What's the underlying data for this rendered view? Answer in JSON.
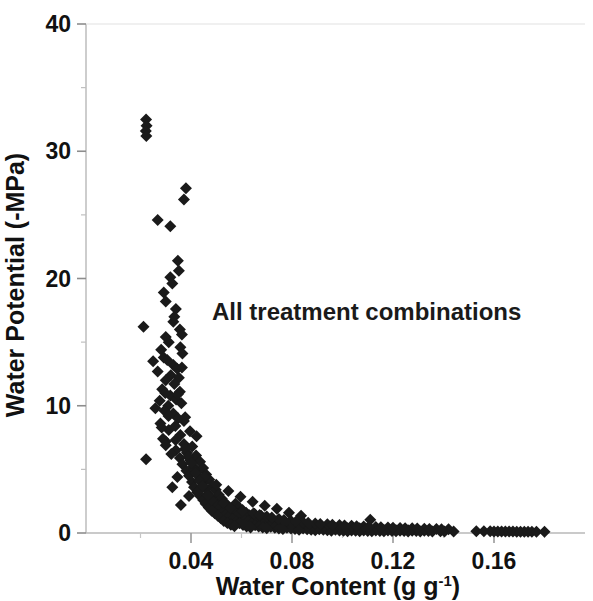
{
  "chart_data": {
    "type": "scatter",
    "title": "",
    "annotation": "All treatment combinations",
    "xlabel_main": "Water Content (g g",
    "xlabel_sup": "-1",
    "xlabel_tail": ")",
    "xlabel_full": "Water Content (g g-1)",
    "ylabel": "Water Potential (-MPa)",
    "xlim": [
      0.013,
      0.185
    ],
    "ylim": [
      0,
      40
    ],
    "xticks": [
      0.04,
      0.08,
      0.12,
      0.16
    ],
    "xtick_labels": [
      "0.04",
      "0.08",
      "0.12",
      "0.16"
    ],
    "yticks": [
      0,
      10,
      20,
      30,
      40
    ],
    "ytick_labels": [
      "0",
      "10",
      "20",
      "30",
      "40"
    ],
    "x_minor_ticks": [
      0.02,
      0.06,
      0.1,
      0.14,
      0.18
    ],
    "y_minor_ticks": [
      5,
      15,
      25,
      35
    ],
    "grid": false,
    "marker": "diamond",
    "marker_color": "#1a1a1a",
    "marker_size": 6,
    "axis_color": "#b8b8b8",
    "series": [
      {
        "name": "All treatment combinations",
        "points": [
          [
            0.0222,
            32.5
          ],
          [
            0.0224,
            32.0
          ],
          [
            0.0221,
            31.6
          ],
          [
            0.0223,
            31.2
          ],
          [
            0.038,
            27.1
          ],
          [
            0.0372,
            26.2
          ],
          [
            0.0268,
            24.6
          ],
          [
            0.0318,
            24.1
          ],
          [
            0.0348,
            21.4
          ],
          [
            0.0352,
            20.6
          ],
          [
            0.0318,
            20.1
          ],
          [
            0.0326,
            19.6
          ],
          [
            0.0292,
            18.9
          ],
          [
            0.03,
            18.2
          ],
          [
            0.0212,
            16.2
          ],
          [
            0.034,
            17.6
          ],
          [
            0.033,
            16.6
          ],
          [
            0.0356,
            16.0
          ],
          [
            0.03,
            15.4
          ],
          [
            0.0312,
            15.0
          ],
          [
            0.0358,
            14.6
          ],
          [
            0.0366,
            14.1
          ],
          [
            0.0282,
            14.4
          ],
          [
            0.0292,
            13.8
          ],
          [
            0.033,
            13.2
          ],
          [
            0.0345,
            12.9
          ],
          [
            0.032,
            12.4
          ],
          [
            0.0352,
            12.2
          ],
          [
            0.03,
            12.0
          ],
          [
            0.0334,
            11.7
          ],
          [
            0.0286,
            11.3
          ],
          [
            0.0356,
            11.1
          ],
          [
            0.0318,
            10.8
          ],
          [
            0.0341,
            10.5
          ],
          [
            0.0362,
            10.2
          ],
          [
            0.031,
            10.0
          ],
          [
            0.0295,
            9.6
          ],
          [
            0.033,
            9.4
          ],
          [
            0.0349,
            9.0
          ],
          [
            0.0372,
            8.8
          ],
          [
            0.0279,
            8.6
          ],
          [
            0.0338,
            8.4
          ],
          [
            0.0312,
            8.1
          ],
          [
            0.0396,
            8.0
          ],
          [
            0.0358,
            7.7
          ],
          [
            0.0422,
            7.6
          ],
          [
            0.0222,
            5.8
          ],
          [
            0.03,
            7.2
          ],
          [
            0.0372,
            7.0
          ],
          [
            0.0405,
            6.8
          ],
          [
            0.034,
            6.5
          ],
          [
            0.0384,
            6.3
          ],
          [
            0.042,
            6.1
          ],
          [
            0.0356,
            5.9
          ],
          [
            0.0398,
            5.7
          ],
          [
            0.0436,
            5.6
          ],
          [
            0.0366,
            5.4
          ],
          [
            0.041,
            5.2
          ],
          [
            0.0448,
            5.1
          ],
          [
            0.0382,
            4.9
          ],
          [
            0.0424,
            4.8
          ],
          [
            0.046,
            4.6
          ],
          [
            0.0392,
            4.5
          ],
          [
            0.0436,
            4.3
          ],
          [
            0.0472,
            4.2
          ],
          [
            0.0346,
            4.4
          ],
          [
            0.0404,
            4.0
          ],
          [
            0.0448,
            3.9
          ],
          [
            0.0486,
            3.7
          ],
          [
            0.0412,
            3.6
          ],
          [
            0.0458,
            3.5
          ],
          [
            0.0498,
            3.4
          ],
          [
            0.0326,
            3.6
          ],
          [
            0.0424,
            3.2
          ],
          [
            0.0468,
            3.1
          ],
          [
            0.051,
            3.0
          ],
          [
            0.0436,
            2.9
          ],
          [
            0.0478,
            2.8
          ],
          [
            0.0522,
            2.7
          ],
          [
            0.0392,
            2.9
          ],
          [
            0.0448,
            2.6
          ],
          [
            0.049,
            2.5
          ],
          [
            0.0534,
            2.4
          ],
          [
            0.0576,
            2.3
          ],
          [
            0.0458,
            2.3
          ],
          [
            0.0502,
            2.2
          ],
          [
            0.0546,
            2.1
          ],
          [
            0.059,
            2.0
          ],
          [
            0.047,
            2.0
          ],
          [
            0.0514,
            1.9
          ],
          [
            0.0558,
            1.85
          ],
          [
            0.0604,
            1.8
          ],
          [
            0.036,
            2.2
          ],
          [
            0.0482,
            1.75
          ],
          [
            0.0526,
            1.7
          ],
          [
            0.0572,
            1.65
          ],
          [
            0.0618,
            1.6
          ],
          [
            0.0494,
            1.55
          ],
          [
            0.054,
            1.5
          ],
          [
            0.0586,
            1.45
          ],
          [
            0.0632,
            1.4
          ],
          [
            0.0678,
            1.35
          ],
          [
            0.0506,
            1.35
          ],
          [
            0.0552,
            1.3
          ],
          [
            0.0598,
            1.25
          ],
          [
            0.0646,
            1.2
          ],
          [
            0.0692,
            1.15
          ],
          [
            0.0518,
            1.15
          ],
          [
            0.0564,
            1.1
          ],
          [
            0.0612,
            1.05
          ],
          [
            0.066,
            1.0
          ],
          [
            0.0706,
            0.95
          ],
          [
            0.053,
            0.95
          ],
          [
            0.0578,
            0.9
          ],
          [
            0.0626,
            0.88
          ],
          [
            0.0674,
            0.85
          ],
          [
            0.0722,
            0.82
          ],
          [
            0.077,
            0.8
          ],
          [
            0.0544,
            0.78
          ],
          [
            0.0592,
            0.76
          ],
          [
            0.064,
            0.74
          ],
          [
            0.0688,
            0.72
          ],
          [
            0.0736,
            0.7
          ],
          [
            0.0784,
            0.68
          ],
          [
            0.0832,
            0.66
          ],
          [
            0.0558,
            0.64
          ],
          [
            0.0606,
            0.62
          ],
          [
            0.0654,
            0.61
          ],
          [
            0.0702,
            0.6
          ],
          [
            0.075,
            0.58
          ],
          [
            0.0798,
            0.57
          ],
          [
            0.0846,
            0.56
          ],
          [
            0.0894,
            0.54
          ],
          [
            0.0572,
            0.53
          ],
          [
            0.062,
            0.52
          ],
          [
            0.0668,
            0.51
          ],
          [
            0.0716,
            0.5
          ],
          [
            0.0764,
            0.49
          ],
          [
            0.0812,
            0.48
          ],
          [
            0.086,
            0.47
          ],
          [
            0.0908,
            0.46
          ],
          [
            0.0956,
            0.45
          ],
          [
            0.0636,
            0.44
          ],
          [
            0.0684,
            0.43
          ],
          [
            0.0732,
            0.42
          ],
          [
            0.078,
            0.42
          ],
          [
            0.0828,
            0.41
          ],
          [
            0.0876,
            0.4
          ],
          [
            0.0924,
            0.4
          ],
          [
            0.0972,
            0.39
          ],
          [
            0.102,
            0.38
          ],
          [
            0.1068,
            0.38
          ],
          [
            0.07,
            0.37
          ],
          [
            0.0748,
            0.36
          ],
          [
            0.0796,
            0.36
          ],
          [
            0.0844,
            0.35
          ],
          [
            0.0892,
            0.35
          ],
          [
            0.094,
            0.34
          ],
          [
            0.0988,
            0.34
          ],
          [
            0.1036,
            0.33
          ],
          [
            0.1084,
            0.33
          ],
          [
            0.1132,
            0.32
          ],
          [
            0.0764,
            0.31
          ],
          [
            0.0812,
            0.31
          ],
          [
            0.086,
            0.3
          ],
          [
            0.0908,
            0.3
          ],
          [
            0.0956,
            0.29
          ],
          [
            0.1004,
            0.29
          ],
          [
            0.1052,
            0.28
          ],
          [
            0.11,
            0.28
          ],
          [
            0.1148,
            0.27
          ],
          [
            0.1196,
            0.27
          ],
          [
            0.0828,
            0.26
          ],
          [
            0.0876,
            0.26
          ],
          [
            0.0924,
            0.25
          ],
          [
            0.0972,
            0.25
          ],
          [
            0.102,
            0.24
          ],
          [
            0.1068,
            0.24
          ],
          [
            0.1116,
            0.23
          ],
          [
            0.1164,
            0.23
          ],
          [
            0.1212,
            0.22
          ],
          [
            0.126,
            0.22
          ],
          [
            0.0892,
            0.21
          ],
          [
            0.094,
            0.21
          ],
          [
            0.0988,
            0.2
          ],
          [
            0.1036,
            0.2
          ],
          [
            0.1084,
            0.2
          ],
          [
            0.1132,
            0.19
          ],
          [
            0.118,
            0.19
          ],
          [
            0.1228,
            0.18
          ],
          [
            0.1276,
            0.18
          ],
          [
            0.1324,
            0.18
          ],
          [
            0.0956,
            0.17
          ],
          [
            0.1004,
            0.17
          ],
          [
            0.1052,
            0.17
          ],
          [
            0.11,
            0.16
          ],
          [
            0.1148,
            0.16
          ],
          [
            0.1196,
            0.16
          ],
          [
            0.1244,
            0.15
          ],
          [
            0.1292,
            0.15
          ],
          [
            0.134,
            0.15
          ],
          [
            0.1388,
            0.14
          ],
          [
            0.102,
            0.14
          ],
          [
            0.1068,
            0.14
          ],
          [
            0.1116,
            0.13
          ],
          [
            0.1164,
            0.13
          ],
          [
            0.1212,
            0.13
          ],
          [
            0.126,
            0.12
          ],
          [
            0.1308,
            0.12
          ],
          [
            0.1356,
            0.12
          ],
          [
            0.1404,
            0.11
          ],
          [
            0.144,
            0.11
          ],
          [
            0.111,
            1.05
          ],
          [
            0.153,
            0.14
          ],
          [
            0.156,
            0.13
          ],
          [
            0.1585,
            0.13
          ],
          [
            0.16,
            0.12
          ],
          [
            0.1615,
            0.12
          ],
          [
            0.163,
            0.12
          ],
          [
            0.1645,
            0.11
          ],
          [
            0.166,
            0.11
          ],
          [
            0.1675,
            0.11
          ],
          [
            0.169,
            0.1
          ],
          [
            0.1705,
            0.1
          ],
          [
            0.172,
            0.1
          ],
          [
            0.1735,
            0.1
          ],
          [
            0.175,
            0.09
          ],
          [
            0.1768,
            0.09
          ],
          [
            0.18,
            0.09
          ],
          [
            0.0306,
            13.6
          ],
          [
            0.0364,
            13.0
          ],
          [
            0.0298,
            11.0
          ],
          [
            0.0348,
            10.9
          ],
          [
            0.0311,
            9.2
          ],
          [
            0.0377,
            9.1
          ],
          [
            0.0289,
            7.4
          ],
          [
            0.0339,
            7.3
          ],
          [
            0.0412,
            5.0
          ],
          [
            0.0452,
            4.4
          ],
          [
            0.05,
            3.8
          ],
          [
            0.0548,
            3.3
          ],
          [
            0.0596,
            2.85
          ],
          [
            0.0644,
            2.45
          ],
          [
            0.0692,
            2.15
          ],
          [
            0.074,
            1.9
          ],
          [
            0.0788,
            1.6
          ],
          [
            0.0836,
            1.35
          ],
          [
            0.048,
            2.6
          ],
          [
            0.0528,
            2.35
          ],
          [
            0.043,
            3.3
          ],
          [
            0.0466,
            2.95
          ],
          [
            0.0556,
            1.95
          ],
          [
            0.0604,
            1.7
          ],
          [
            0.0652,
            1.5
          ],
          [
            0.07,
            1.3
          ],
          [
            0.0748,
            1.1
          ],
          [
            0.0796,
            0.95
          ],
          [
            0.0844,
            0.85
          ],
          [
            0.0892,
            0.75
          ],
          [
            0.094,
            0.68
          ],
          [
            0.0988,
            0.62
          ],
          [
            0.1036,
            0.56
          ],
          [
            0.1084,
            0.51
          ],
          [
            0.1132,
            0.47
          ],
          [
            0.118,
            0.43
          ],
          [
            0.1228,
            0.4
          ],
          [
            0.1276,
            0.37
          ],
          [
            0.1324,
            0.34
          ],
          [
            0.1372,
            0.31
          ],
          [
            0.142,
            0.29
          ],
          [
            0.0648,
            1.55
          ],
          [
            0.0672,
            1.42
          ],
          [
            0.072,
            1.22
          ],
          [
            0.0768,
            1.02
          ],
          [
            0.0816,
            0.9
          ],
          [
            0.0864,
            0.8
          ],
          [
            0.0912,
            0.71
          ],
          [
            0.096,
            0.64
          ],
          [
            0.1008,
            0.59
          ],
          [
            0.1056,
            0.53
          ],
          [
            0.1104,
            0.49
          ],
          [
            0.1152,
            0.45
          ],
          [
            0.12,
            0.41
          ],
          [
            0.1248,
            0.38
          ],
          [
            0.1296,
            0.35
          ],
          [
            0.1344,
            0.32
          ],
          [
            0.1392,
            0.3
          ],
          [
            0.0376,
            6.6
          ],
          [
            0.0388,
            6.0
          ],
          [
            0.0402,
            5.5
          ],
          [
            0.0418,
            4.7
          ],
          [
            0.0434,
            4.1
          ],
          [
            0.0444,
            3.7
          ],
          [
            0.03,
            6.9
          ],
          [
            0.0322,
            6.2
          ],
          [
            0.0268,
            12.7
          ],
          [
            0.0276,
            10.4
          ],
          [
            0.0259,
            9.8
          ],
          [
            0.0284,
            8.3
          ],
          [
            0.0334,
            17.0
          ],
          [
            0.0364,
            15.6
          ],
          [
            0.025,
            13.5
          ]
        ]
      }
    ]
  }
}
